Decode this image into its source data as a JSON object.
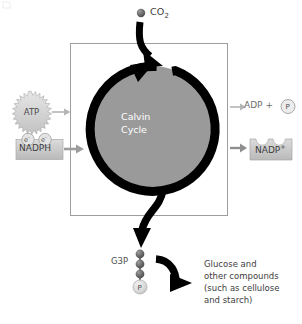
{
  "diagram": {
    "title": "Calvin Cycle",
    "center_label_line1": "Calvin",
    "center_label_line2": "Cycle",
    "inputs": {
      "co2": {
        "label": "CO",
        "sub": "2",
        "icon": "co2-molecule-sphere"
      },
      "atp": {
        "label": "ATP",
        "shape": "starburst"
      },
      "nadph": {
        "label": "NADPH",
        "shape": "rectangle",
        "electrons": [
          "e",
          "e"
        ],
        "electron_charge": "-"
      }
    },
    "outputs": {
      "adp": {
        "label": "ADP +",
        "phosphate": "P"
      },
      "nadp_plus": {
        "label": "NADP",
        "sup": "+",
        "shape": "notched-rectangle"
      },
      "g3p": {
        "label": "G3P",
        "spheres": 3,
        "phosphate": "P"
      },
      "products": {
        "line1": "Glucose and",
        "line2": "other compounds",
        "line3": "(such as cellulose",
        "line4": "and starch)"
      }
    },
    "colors": {
      "cycle_fill": "#9a9a9a",
      "ring": "#000000",
      "box_stroke": "#9e9e9e",
      "arrow_gray": "#b5b5b5",
      "text": "#3d3d3d",
      "center_text": "#ffffff",
      "sphere_dark": "#6b6b6b",
      "phosphate_fill": "#d9d9d9"
    }
  }
}
